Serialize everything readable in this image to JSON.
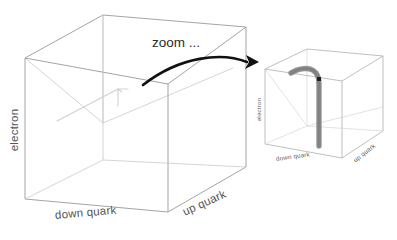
{
  "figure": {
    "title": "",
    "background_color": "#ffffff"
  },
  "annotation": {
    "zoom_label": "zoom ...",
    "arrow_name": "zoom-arrow"
  },
  "left_cube": {
    "name": "coarse-resolution-cube",
    "axes": {
      "vertical_label": "electron",
      "left_horizontal_label": "down quark",
      "right_horizontal_label": "up quark"
    },
    "track": {
      "description": "faint electron trajectory at coarse resolution",
      "color": "#d0d0d0"
    }
  },
  "right_cube": {
    "name": "zoomed-resolution-cube",
    "axes": {
      "vertical_label": "electron",
      "left_horizontal_label": "down quark",
      "right_horizontal_label": "up quark"
    },
    "track": {
      "description": "thick electron trajectory with bend vertex",
      "color": "#8e8e8e",
      "vertex_color": "#1d1d1d"
    }
  },
  "colors": {
    "cube_edge": "#9a9a9a",
    "cube_edge_faint": "#c9c9c9",
    "arrow": "#111111",
    "label_text": "#555555",
    "zoom_text": "#2b2b2b"
  }
}
